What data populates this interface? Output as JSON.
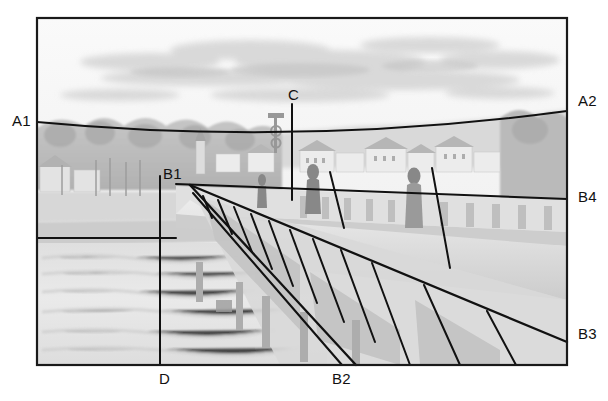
{
  "figure": {
    "frame": {
      "x": 37,
      "y": 18,
      "width": 530,
      "height": 347,
      "stroke": "#1a1a1a",
      "stroke_width": 2.2
    },
    "background_note": "grayscale painting of a river bridge with town, trees and sky",
    "colors": {
      "line": "#111111",
      "label": "#111111",
      "paper": "#ffffff",
      "sky": "#f6f6f6",
      "water": "#e9e9e9",
      "hills": "#d8d8d8"
    },
    "labels": [
      {
        "id": "A1",
        "text": "A1",
        "x": 12,
        "y": 112,
        "anchor": "left"
      },
      {
        "id": "A2",
        "text": "A2",
        "x": 578,
        "y": 92,
        "anchor": "left"
      },
      {
        "id": "B4",
        "text": "B4",
        "x": 578,
        "y": 188,
        "anchor": "left"
      },
      {
        "id": "B3",
        "text": "B3",
        "x": 578,
        "y": 325,
        "anchor": "left"
      },
      {
        "id": "B1",
        "text": "B1",
        "x": 163,
        "y": 165,
        "anchor": "left"
      },
      {
        "id": "B2",
        "text": "B2",
        "x": 332,
        "y": 370,
        "anchor": "left"
      },
      {
        "id": "C",
        "text": "C",
        "x": 288,
        "y": 86,
        "anchor": "left"
      },
      {
        "id": "D",
        "text": "D",
        "x": 159,
        "y": 370,
        "anchor": "left"
      }
    ],
    "construction_lines": [
      {
        "name": "horizon-curve-A1-A2",
        "type": "curve",
        "d": "M 37 122 Q 300 147 567 111"
      },
      {
        "name": "vertical-axis-C",
        "type": "line",
        "x1": 292,
        "y1": 104,
        "x2": 292,
        "y2": 200
      },
      {
        "name": "vertical-axis-D",
        "type": "line",
        "x1": 160,
        "y1": 176,
        "x2": 160,
        "y2": 365
      },
      {
        "name": "left-horizontal-upper",
        "type": "line",
        "x1": 37,
        "y1": 238,
        "x2": 176,
        "y2": 238
      },
      {
        "name": "right-horizontal-B4",
        "type": "line",
        "x1": 176,
        "y1": 184,
        "x2": 567,
        "y2": 199
      },
      {
        "name": "b1-ray-to-B3",
        "type": "line",
        "x1": 190,
        "y1": 185,
        "x2": 567,
        "y2": 342
      },
      {
        "name": "b1-ray-to-B2",
        "type": "line",
        "x1": 190,
        "y1": 185,
        "x2": 356,
        "y2": 365
      },
      {
        "name": "b1-ray-lower",
        "type": "line",
        "x1": 193,
        "y1": 193,
        "x2": 342,
        "y2": 365
      },
      {
        "name": "rung-1",
        "type": "line",
        "x1": 203,
        "y1": 196,
        "x2": 212,
        "y2": 218
      },
      {
        "name": "rung-2",
        "type": "line",
        "x1": 218,
        "y1": 200,
        "x2": 232,
        "y2": 234
      },
      {
        "name": "rung-3",
        "type": "line",
        "x1": 234,
        "y1": 207,
        "x2": 252,
        "y2": 252
      },
      {
        "name": "rung-4",
        "type": "line",
        "x1": 251,
        "y1": 214,
        "x2": 272,
        "y2": 269
      },
      {
        "name": "rung-5",
        "type": "line",
        "x1": 269,
        "y1": 221,
        "x2": 293,
        "y2": 286
      },
      {
        "name": "rung-6",
        "type": "line",
        "x1": 290,
        "y1": 230,
        "x2": 317,
        "y2": 303
      },
      {
        "name": "rung-7",
        "type": "line",
        "x1": 313,
        "y1": 239,
        "x2": 344,
        "y2": 322
      },
      {
        "name": "rung-8",
        "type": "line",
        "x1": 341,
        "y1": 250,
        "x2": 375,
        "y2": 342
      },
      {
        "name": "rung-9",
        "type": "line",
        "x1": 372,
        "y1": 263,
        "x2": 410,
        "y2": 365
      },
      {
        "name": "rung-10",
        "type": "line",
        "x1": 424,
        "y1": 285,
        "x2": 460,
        "y2": 365
      },
      {
        "name": "rung-11",
        "type": "line",
        "x1": 487,
        "y1": 311,
        "x2": 516,
        "y2": 365
      },
      {
        "name": "figure-mark-left",
        "type": "line",
        "x1": 330,
        "y1": 172,
        "x2": 344,
        "y2": 228
      },
      {
        "name": "figure-mark-right",
        "type": "line",
        "x1": 432,
        "y1": 168,
        "x2": 450,
        "y2": 268
      }
    ]
  }
}
